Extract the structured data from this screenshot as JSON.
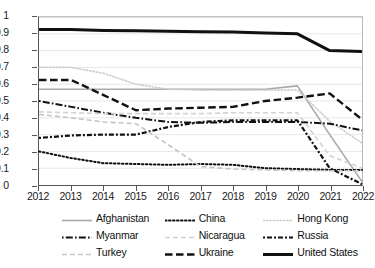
{
  "chart_data": {
    "type": "line",
    "title": "",
    "xlabel": "",
    "ylabel": "",
    "x": [
      2012,
      2013,
      2014,
      2015,
      2016,
      2017,
      2018,
      2019,
      2020,
      2021,
      2022
    ],
    "xlim": [
      2012,
      2022
    ],
    "ylim": [
      0,
      1
    ],
    "yticks": [
      0,
      0.1,
      0.2,
      0.3,
      0.4,
      0.5,
      0.6,
      0.7,
      0.8,
      0.9,
      1
    ],
    "ytick_labels": [
      "0",
      "0.1",
      "0.2",
      "0.3",
      "0.4",
      "0.5",
      "0.6",
      "0.7",
      "0.8",
      "0.9",
      "1"
    ],
    "xtick_labels": [
      "2012",
      "2013",
      "2014",
      "2015",
      "2016",
      "2017",
      "2018",
      "2019",
      "2020",
      "2021",
      "2022"
    ],
    "grid": true,
    "grid_axis": "y",
    "legend_position": "bottom",
    "legend_columns": 3,
    "series": [
      {
        "name": "Afghanistan",
        "style": "solid",
        "color": "#a9a9a9",
        "width": 1.6,
        "dash": "none",
        "values": [
          0.57,
          0.57,
          0.57,
          0.57,
          0.57,
          0.57,
          0.57,
          0.57,
          0.59,
          0.3,
          0.02
        ]
      },
      {
        "name": "China",
        "style": "dotted",
        "color": "#111111",
        "width": 2.0,
        "dash": "1.6 2.4",
        "values": [
          0.2,
          0.16,
          0.13,
          0.125,
          0.12,
          0.125,
          0.12,
          0.1,
          0.095,
          0.09,
          0.09
        ]
      },
      {
        "name": "Hong Kong",
        "style": "dotted",
        "color": "#cdcdcd",
        "width": 1.6,
        "dash": "1.4 2.0",
        "values": [
          0.7,
          0.7,
          0.665,
          0.6,
          0.57,
          0.565,
          0.565,
          0.565,
          0.565,
          0.38,
          0.25
        ]
      },
      {
        "name": "Myanmar",
        "style": "dashdot",
        "color": "#111111",
        "width": 2.0,
        "dash": "1.6 2.2 7 2.2",
        "values": [
          0.5,
          0.465,
          0.43,
          0.4,
          0.375,
          0.37,
          0.375,
          0.375,
          0.375,
          0.365,
          0.325
        ]
      },
      {
        "name": "Nicaragua",
        "style": "dashed",
        "color": "#d2d2d2",
        "width": 1.6,
        "dash": "5 3",
        "values": [
          0.435,
          0.43,
          0.425,
          0.425,
          0.425,
          0.425,
          0.43,
          0.43,
          0.43,
          0.175,
          0.1
        ]
      },
      {
        "name": "Russia",
        "style": "dashdot",
        "color": "#111111",
        "width": 2.2,
        "dash": "2 2 5 2",
        "values": [
          0.28,
          0.295,
          0.3,
          0.3,
          0.345,
          0.375,
          0.385,
          0.385,
          0.385,
          0.1,
          0.005
        ]
      },
      {
        "name": "Turkey",
        "style": "dashed",
        "color": "#c4c4c4",
        "width": 1.6,
        "dash": "5 3",
        "values": [
          0.42,
          0.4,
          0.375,
          0.365,
          0.24,
          0.11,
          0.095,
          0.09,
          0.085,
          0.085,
          0.085
        ]
      },
      {
        "name": "Ukraine",
        "style": "dashed",
        "color": "#111111",
        "width": 2.4,
        "dash": "7.5 3.5",
        "values": [
          0.625,
          0.625,
          0.535,
          0.445,
          0.455,
          0.46,
          0.465,
          0.5,
          0.52,
          0.545,
          0.39
        ]
      },
      {
        "name": "United States",
        "style": "solid",
        "color": "#111111",
        "width": 3.0,
        "dash": "none",
        "values": [
          0.925,
          0.925,
          0.92,
          0.918,
          0.915,
          0.912,
          0.91,
          0.905,
          0.9,
          0.8,
          0.795
        ]
      }
    ]
  },
  "legend": {
    "items": [
      {
        "label": "Afghanistan"
      },
      {
        "label": "China"
      },
      {
        "label": "Hong Kong"
      },
      {
        "label": "Myanmar"
      },
      {
        "label": "Nicaragua"
      },
      {
        "label": "Russia"
      },
      {
        "label": "Turkey"
      },
      {
        "label": "Ukraine"
      },
      {
        "label": "United States"
      }
    ]
  }
}
